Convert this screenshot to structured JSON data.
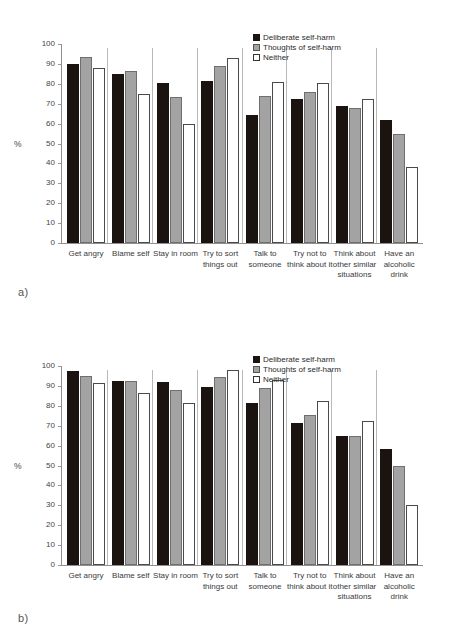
{
  "figure": {
    "panels": [
      {
        "tag": "a)",
        "tag_name": "panel-a"
      },
      {
        "tag": "b)",
        "tag_name": "panel-b"
      }
    ]
  },
  "legend": {
    "entries": [
      {
        "label": "Deliberate self-harm",
        "color": "#1a1310"
      },
      {
        "label": "Thoughts of self-harm",
        "color": "#a3a3a3"
      },
      {
        "label": "Neither",
        "color": "#ffffff"
      }
    ]
  },
  "axis": {
    "ylabel": "%",
    "yticks": [
      "100",
      "90",
      "80",
      "70",
      "60",
      "50",
      "40",
      "30",
      "20",
      "10",
      "0"
    ]
  },
  "categories": [
    "Get angry",
    "Blame self",
    "Stay in room",
    "Try to sort\nthings out",
    "Talk to\nsomeone",
    "Try not to\nthink about it",
    "Think about\nother similar\nsituations",
    "Have an\nalcoholic\ndrink"
  ],
  "chart_data": [
    {
      "type": "bar",
      "panel": "a)",
      "title": "",
      "xlabel": "",
      "ylabel": "%",
      "ylim": [
        0,
        100
      ],
      "ytick_step": 10,
      "grid": false,
      "legend_position": "top-right",
      "categories": [
        "Get angry",
        "Blame self",
        "Stay in room",
        "Try to sort things out",
        "Talk to someone",
        "Try not to think about it",
        "Think about other similar situations",
        "Have an alcoholic drink"
      ],
      "series": [
        {
          "name": "Deliberate self-harm",
          "color": "#1a1310",
          "values": [
            90,
            85,
            80.5,
            81.5,
            64.5,
            72.5,
            69,
            62
          ]
        },
        {
          "name": "Thoughts of self-harm",
          "color": "#a3a3a3",
          "values": [
            93.5,
            86.5,
            73.5,
            89,
            74,
            76,
            68,
            55
          ]
        },
        {
          "name": "Neither",
          "color": "#ffffff",
          "values": [
            88,
            75,
            60,
            93,
            81,
            80.5,
            72.5,
            38
          ]
        }
      ]
    },
    {
      "type": "bar",
      "panel": "b)",
      "title": "",
      "xlabel": "",
      "ylabel": "%",
      "ylim": [
        0,
        100
      ],
      "ytick_step": 10,
      "grid": false,
      "legend_position": "top-right",
      "categories": [
        "Get angry",
        "Blame self",
        "Stay in room",
        "Try to sort things out",
        "Talk to someone",
        "Try not to think about it",
        "Think about other similar situations",
        "Have an alcoholic drink"
      ],
      "series": [
        {
          "name": "Deliberate self-harm",
          "color": "#1a1310",
          "values": [
            97.5,
            92.5,
            92,
            89.5,
            81.5,
            71.5,
            65,
            58.5
          ]
        },
        {
          "name": "Thoughts of self-harm",
          "color": "#a3a3a3",
          "values": [
            95,
            92.5,
            88,
            94.5,
            89,
            75.5,
            65,
            50
          ]
        },
        {
          "name": "Neither",
          "color": "#ffffff",
          "values": [
            91.5,
            86.5,
            81.5,
            98,
            93,
            82.5,
            72.5,
            30
          ]
        }
      ]
    }
  ]
}
